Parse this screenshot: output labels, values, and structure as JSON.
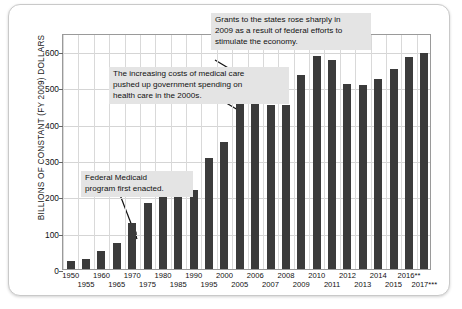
{
  "chart_data": {
    "type": "bar",
    "title": "",
    "xlabel": "",
    "ylabel": "BILLIONS OF CONSTANT (FY 2009) DOLLARS",
    "ylim": [
      0,
      650
    ],
    "yticks": [
      0,
      100,
      200,
      300,
      400,
      500,
      600
    ],
    "ytick_labels": [
      "0",
      "100",
      "200",
      "300",
      "400",
      "500",
      "600"
    ],
    "grid": true,
    "legend": "none",
    "categories": [
      "1950",
      "1955",
      "1960",
      "1965",
      "1970",
      "1975",
      "1980",
      "1985",
      "1990",
      "1995",
      "2000",
      "2005",
      "2006",
      "2007",
      "2008",
      "2009",
      "2010",
      "2011",
      "2012",
      "2013",
      "2014",
      "2015",
      "2016**",
      "2017***"
    ],
    "values": [
      22,
      28,
      50,
      72,
      127,
      182,
      228,
      197,
      217,
      307,
      350,
      463,
      455,
      452,
      452,
      533,
      588,
      576,
      510,
      506,
      523,
      551,
      583,
      595
    ],
    "annotations": [
      {
        "name": "grants-2009-note",
        "text": "Grants to the states rose sharply in\n2009 as a result of federal efforts to\nstimulate the economy.",
        "target_category": "2009"
      },
      {
        "name": "medical-costs-note",
        "text": "The increasing costs of medical care\npushed up government spending on\nhealth care in the 2000s.",
        "target_category": "2005"
      },
      {
        "name": "medicaid-enacted-note",
        "text": "Federal Medicaid\nprogram first enacted.",
        "target_category": "1965"
      }
    ],
    "colors": {
      "bar": "#3b3b3b",
      "grid": "#d5d5d5",
      "axis": "#9a9a9a",
      "note_background": "#e4e4e4",
      "text": "#111111"
    }
  }
}
